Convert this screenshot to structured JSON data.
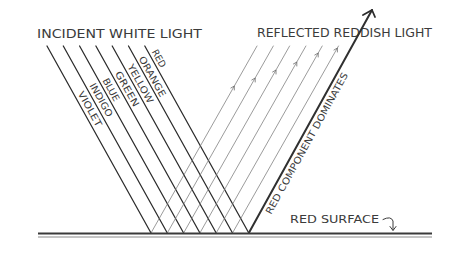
{
  "diagram": {
    "title_incident": "INCIDENT WHITE LIGHT",
    "title_reflected": "REFLECTED REDDISH LIGHT",
    "spectrum_labels": [
      "VIOLET",
      "INDIGO",
      "BLUE",
      "GREEN",
      "YELLOW",
      "ORANGE",
      "RED"
    ],
    "reflected_annotation": "RED COMPONENT DOMINATES",
    "surface_label": "RED SURFACE"
  }
}
